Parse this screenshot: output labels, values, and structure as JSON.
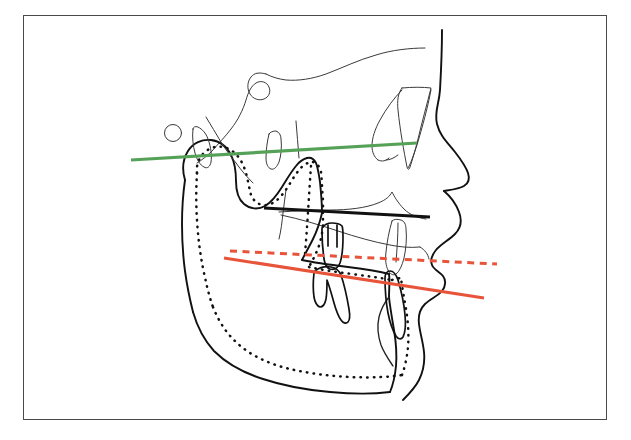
{
  "figure": {
    "kind": "cephalometric-lateral-tracing",
    "background_color": "#ffffff",
    "frame_border_color": "#4a4a4a",
    "caption": ""
  },
  "reference_lines": [
    {
      "id": "fh-plane",
      "name": "frankfort-horizontal-plane",
      "style": "solid",
      "color": "#56a158",
      "x1": 131,
      "y1": 160,
      "x2": 417,
      "y2": 143
    },
    {
      "id": "palatal-plane",
      "name": "palatal-plane",
      "style": "solid",
      "color": "#111111",
      "x1": 264,
      "y1": 208,
      "x2": 430,
      "y2": 217
    },
    {
      "id": "occlusal-plane-post",
      "name": "occlusal-plane-post-treatment",
      "style": "solid",
      "color": "#e7543a",
      "x1": 224,
      "y1": 258,
      "x2": 484,
      "y2": 298
    },
    {
      "id": "occlusal-plane-pre",
      "name": "occlusal-plane-pre-treatment",
      "style": "dashed",
      "color": "#e7543a",
      "x1": 230,
      "y1": 251,
      "x2": 497,
      "y2": 264
    }
  ],
  "structures": {
    "soft_tissue_profile": "soft-tissue-profile-outline",
    "cranial_base": "anterior-cranial-base-outline",
    "sella_turcica": "sella-turcica-outline",
    "orbit": "orbital-rim-outline",
    "maxilla": "maxilla-outline",
    "mandible_solid": "mandible-outline-solid",
    "mandible_dashed": "mandible-outline-superimposed-dashed",
    "upper_molar": "upper-first-molar",
    "lower_molar": "lower-first-molar",
    "upper_incisor": "upper-central-incisor",
    "lower_incisor": "lower-central-incisor",
    "landmark_point": "porion-landmark-circle"
  },
  "colors": {
    "green": "#56a158",
    "red": "#e7543a",
    "black": "#111111",
    "grey": "#3a3a3a",
    "frame": "#4a4a4a"
  }
}
